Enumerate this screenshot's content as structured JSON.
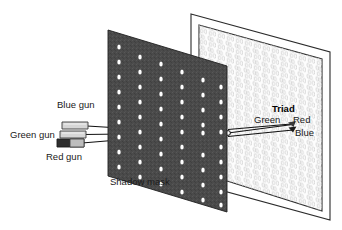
{
  "figure": {
    "background_color": "#ffffff"
  },
  "labels": {
    "blue_gun": "Blue gun",
    "green_gun": "Green gun",
    "red_gun": "Red gun",
    "shadow_mask": "Shadow mask",
    "triad": "Triad",
    "triad_green": "Green",
    "triad_red": "Red",
    "triad_blue": "Blue"
  },
  "colors": {
    "mask_fill": "#4a4a4a",
    "mask_hole": "#ffffff",
    "mask_edge": "#1f1f1f",
    "screen_fill": "#fdfdfd",
    "screen_border": "#2b2b2b",
    "phosphor": "#cfcfcf",
    "gun_body_light": "#d6d6d6",
    "gun_body_dark": "#2e2e2e",
    "gun_outline": "#3a3a3a",
    "beam": "#101010",
    "text": "#1a1a1a"
  },
  "geometry": {
    "mask_corners": "108,30 227,66 227,212 108,176",
    "mask_hole_rows": 9,
    "mask_hole_cols": 6,
    "screen_outer_corners": "191,14 330,52 330,220 191,182",
    "screen_inner_corners": "199,25 322,59 322,211 199,172",
    "convergence_point_x": 203,
    "convergence_point_y": 133,
    "triad_point_x": 292,
    "triad_point_y": 125
  }
}
